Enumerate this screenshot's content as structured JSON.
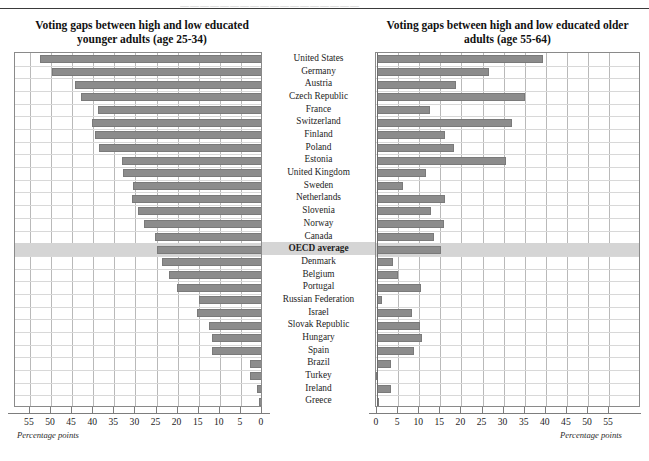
{
  "page": {
    "faint_header_text": "——————————————————"
  },
  "left_panel": {
    "title": "Voting gaps between high and low educated younger adults (age 25-34)",
    "axis_caption": "Percentage points",
    "tick_labels": [
      "55",
      "50",
      "45",
      "40",
      "35",
      "30",
      "25",
      "20",
      "15",
      "10",
      "5",
      "0"
    ]
  },
  "right_panel": {
    "title": "Voting gaps between high and low educated older adults (age 55-64)",
    "axis_caption": "Percentage points",
    "tick_labels": [
      "0",
      "5",
      "10",
      "15",
      "20",
      "25",
      "30",
      "35",
      "40",
      "45",
      "50",
      "55"
    ]
  },
  "highlight_row": "OECD average",
  "colors": {
    "bar_fill": "#8c8c8c",
    "bar_stroke": "#7a7a7a",
    "highlight_band": "#d5d5d5",
    "grid": "#b9b9b9",
    "frame": "#8a8a8a",
    "zero_line": "#6d6d6d"
  },
  "chart_data": {
    "type": "bar",
    "orientation": "horizontal",
    "layout": "back-to-back butterfly (two mirrored panels sharing centred category labels)",
    "grid": true,
    "legend_position": "none",
    "categories": [
      "United States",
      "Germany",
      "Austria",
      "Czech Republic",
      "France",
      "Switzerland",
      "Finland",
      "Poland",
      "Estonia",
      "United Kingdom",
      "Sweden",
      "Netherlands",
      "Slovenia",
      "Norway",
      "Canada",
      "OECD average",
      "Denmark",
      "Belgium",
      "Portugal",
      "Russian Federation",
      "Israel",
      "Slovak Republic",
      "Hungary",
      "Spain",
      "Brazil",
      "Turkey",
      "Ireland",
      "Greece"
    ],
    "series": [
      {
        "name": "Voting gaps between high and low educated younger adults (age 25-34)",
        "panel": "left",
        "xlabel": "Percentage points",
        "xlim": [
          0,
          55
        ],
        "axis_direction": "reversed (55 at far left, 0 at centre)",
        "values": [
          52.5,
          49.8,
          44.3,
          43.0,
          38.9,
          40.3,
          39.6,
          38.6,
          33.2,
          32.9,
          30.6,
          30.8,
          29.4,
          28.0,
          25.4,
          25.0,
          23.7,
          22.0,
          20.1,
          14.9,
          15.4,
          12.6,
          11.8,
          11.8,
          2.8,
          2.8,
          1.2,
          0.7
        ]
      },
      {
        "name": "Voting gaps between high and low educated older adults (age 55-64)",
        "panel": "right",
        "xlabel": "Percentage points",
        "xlim": [
          0,
          55
        ],
        "axis_direction": "normal (0 at centre, 55 at far right)",
        "values": [
          39.3,
          26.5,
          18.7,
          35.0,
          12.6,
          32.0,
          16.1,
          18.2,
          30.6,
          11.6,
          6.2,
          16.1,
          12.8,
          15.9,
          13.5,
          15.2,
          3.7,
          5.0,
          10.4,
          1.2,
          8.3,
          10.2,
          10.6,
          8.8,
          3.3,
          -2.0,
          3.3,
          0.5
        ]
      }
    ]
  }
}
